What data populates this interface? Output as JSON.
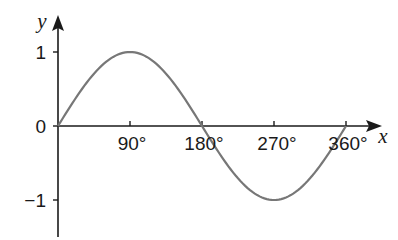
{
  "chart_data": {
    "type": "line",
    "title": "",
    "xlabel": "x",
    "ylabel": "y",
    "x_tick_labels": [
      "90°",
      "180°",
      "270°",
      "360°"
    ],
    "x_ticks": [
      90,
      180,
      270,
      360
    ],
    "y_tick_labels": [
      "1",
      "0",
      "−1"
    ],
    "y_ticks": [
      1,
      0,
      -1
    ],
    "xlim": [
      0,
      360
    ],
    "ylim": [
      -1,
      1
    ],
    "grid": false,
    "legend": null,
    "series": [
      {
        "name": "y = sin x",
        "color": "#777777",
        "x": [
          0,
          30,
          45,
          60,
          90,
          120,
          135,
          150,
          180,
          210,
          225,
          240,
          270,
          300,
          315,
          330,
          360
        ],
        "y": [
          0,
          0.5,
          0.707,
          0.866,
          1,
          0.866,
          0.707,
          0.5,
          0,
          -0.5,
          -0.707,
          -0.866,
          -1,
          -0.866,
          -0.707,
          -0.5,
          0
        ]
      }
    ]
  },
  "colors": {
    "axis": "#1a1a1a",
    "curve": "#777777",
    "background": "#ffffff"
  }
}
